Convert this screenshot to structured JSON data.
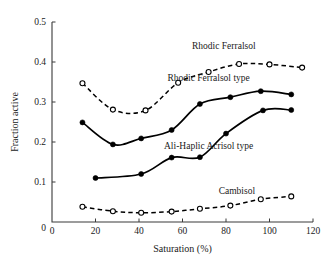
{
  "chart_data": {
    "type": "line",
    "title": "",
    "xlabel": "Saturation (%)",
    "ylabel": "Fraction active",
    "xlim": [
      0,
      120
    ],
    "ylim": [
      0,
      0.5
    ],
    "xticks": [
      0,
      20,
      40,
      60,
      80,
      100,
      120
    ],
    "xtick_labels": [
      "0",
      "20",
      "40",
      "60",
      "80",
      "100",
      "120"
    ],
    "yticks": [
      0,
      0.1,
      0.2,
      0.3,
      0.4,
      0.5
    ],
    "ytick_labels": [
      "0",
      "0.1",
      "0.2",
      "0.3",
      "0.4",
      "0.5"
    ],
    "grid": false,
    "legend_position": "inline-annotations",
    "series": [
      {
        "name": "Rhodic Ferralsol",
        "label": "Rhodic Ferralsol",
        "style": "dashed",
        "marker": "open-circle",
        "color": "#000000",
        "x": [
          14,
          28,
          43,
          58,
          72,
          86,
          100,
          115
        ],
        "y": [
          0.347,
          0.281,
          0.279,
          0.348,
          0.375,
          0.395,
          0.394,
          0.386
        ],
        "label_pos": {
          "x": 79,
          "y": 0.432
        }
      },
      {
        "name": "Rhodic Ferralsol type",
        "label": "Rhodic Ferralsol type",
        "style": "solid",
        "marker": "filled-circle",
        "color": "#000000",
        "x": [
          14,
          28,
          41,
          55,
          68,
          82,
          96,
          110
        ],
        "y": [
          0.249,
          0.194,
          0.209,
          0.23,
          0.295,
          0.312,
          0.327,
          0.319
        ],
        "label_pos": {
          "x": 72,
          "y": 0.352
        }
      },
      {
        "name": "Ali-Haplic Acrisol type",
        "label": "Ali-Haplic Acrisol type",
        "style": "solid",
        "marker": "filled-circle",
        "color": "#000000",
        "x": [
          20,
          41,
          55,
          68,
          80,
          97,
          110
        ],
        "y": [
          0.11,
          0.12,
          0.161,
          0.162,
          0.221,
          0.279,
          0.28
        ],
        "label_pos": {
          "x": 72,
          "y": 0.183
        }
      },
      {
        "name": "Cambisol",
        "label": "Cambisol",
        "style": "dashed",
        "marker": "open-circle",
        "color": "#000000",
        "x": [
          14,
          28,
          41,
          55,
          68,
          82,
          96,
          110
        ],
        "y": [
          0.038,
          0.027,
          0.023,
          0.026,
          0.033,
          0.041,
          0.057,
          0.064
        ],
        "label_pos": {
          "x": 85,
          "y": 0.07
        }
      }
    ]
  }
}
